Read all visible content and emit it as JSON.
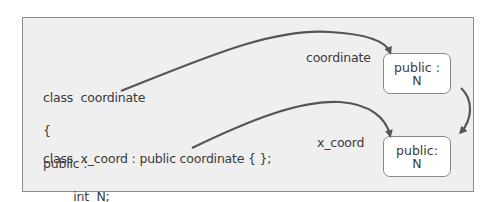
{
  "code": {
    "lines": [
      "class  coordinate",
      "{",
      "public :",
      "        int  N;",
      "};"
    ],
    "derived": "class  x_coord : public coordinate { };"
  },
  "labels": {
    "base_object": "coordinate",
    "derived_object": "x_coord"
  },
  "boxes": [
    {
      "line1": "public :",
      "line2": "N"
    },
    {
      "line1": "public:",
      "line2": "N"
    }
  ],
  "colors": {
    "panel": "#efefef",
    "border": "#8a8a8a",
    "arrow": "#555555",
    "text": "#3a3a3a"
  }
}
